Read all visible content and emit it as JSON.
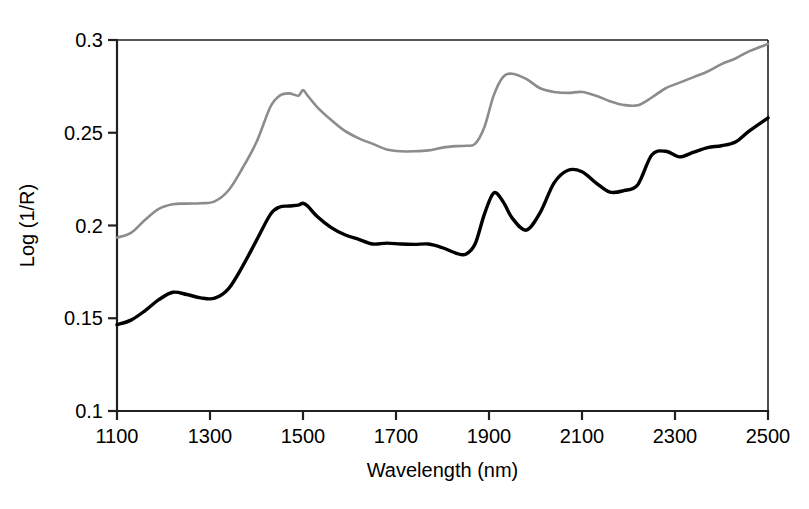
{
  "chart_data": {
    "type": "line",
    "title": "",
    "xlabel": "Wavelength (nm)",
    "ylabel": "Log (1/R)",
    "xlim": [
      1100,
      2500
    ],
    "ylim": [
      0.1,
      0.3
    ],
    "xticks": [
      1100,
      1300,
      1500,
      1700,
      1900,
      2100,
      2300,
      2500
    ],
    "xticklabels": [
      "1100",
      "1300",
      "1500",
      "1700",
      "1900",
      "2100",
      "2300",
      "2500"
    ],
    "yticks": [
      0.1,
      0.15,
      0.2,
      0.25,
      0.3
    ],
    "yticklabels": [
      "0.1",
      "0.15",
      "0.2",
      "0.25",
      "0.3"
    ],
    "grid": false,
    "legend": "none",
    "x": [
      1100,
      1130,
      1160,
      1190,
      1220,
      1250,
      1280,
      1310,
      1340,
      1370,
      1400,
      1430,
      1450,
      1470,
      1490,
      1500,
      1510,
      1530,
      1560,
      1590,
      1620,
      1650,
      1680,
      1710,
      1740,
      1770,
      1800,
      1830,
      1850,
      1870,
      1890,
      1910,
      1930,
      1950,
      1980,
      2010,
      2040,
      2070,
      2100,
      2130,
      2160,
      2190,
      2220,
      2250,
      2280,
      2310,
      2340,
      2370,
      2400,
      2430,
      2460,
      2500
    ],
    "series": [
      {
        "name": "upper-curve",
        "color": "#8c8c8c",
        "linewidth": 2.6,
        "values": [
          0.1935,
          0.196,
          0.203,
          0.209,
          0.2115,
          0.2118,
          0.212,
          0.213,
          0.219,
          0.231,
          0.245,
          0.264,
          0.27,
          0.2712,
          0.27,
          0.273,
          0.27,
          0.264,
          0.257,
          0.251,
          0.247,
          0.244,
          0.241,
          0.24,
          0.24,
          0.2405,
          0.242,
          0.2428,
          0.243,
          0.244,
          0.253,
          0.27,
          0.28,
          0.2818,
          0.279,
          0.274,
          0.272,
          0.2715,
          0.272,
          0.27,
          0.267,
          0.265,
          0.2648,
          0.269,
          0.274,
          0.277,
          0.28,
          0.283,
          0.287,
          0.29,
          0.294,
          0.2978
        ]
      },
      {
        "name": "lower-curve",
        "color": "#000000",
        "linewidth": 3.4,
        "values": [
          0.1465,
          0.149,
          0.154,
          0.16,
          0.164,
          0.1628,
          0.161,
          0.1608,
          0.166,
          0.178,
          0.192,
          0.206,
          0.21,
          0.2105,
          0.211,
          0.212,
          0.2105,
          0.205,
          0.199,
          0.195,
          0.1925,
          0.19,
          0.1905,
          0.19,
          0.1898,
          0.19,
          0.188,
          0.185,
          0.1845,
          0.19,
          0.206,
          0.2175,
          0.213,
          0.204,
          0.1975,
          0.207,
          0.223,
          0.2298,
          0.229,
          0.223,
          0.218,
          0.2188,
          0.222,
          0.238,
          0.24,
          0.237,
          0.2395,
          0.242,
          0.243,
          0.245,
          0.251,
          0.258
        ]
      }
    ]
  },
  "axes": {
    "tick_color": "#231f20"
  }
}
